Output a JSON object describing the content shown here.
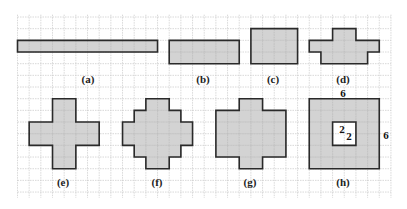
{
  "figure": {
    "grid": {
      "origin_x": 17.5,
      "origin_y": 17,
      "cell": 11.67,
      "cols": 32,
      "rows": 15.5,
      "line_color": "#c8c8c8",
      "fill_color": "#d3d3d3",
      "stroke_color": "#2a2a2a"
    },
    "shapes": [
      {
        "id": "a",
        "label": "(a)",
        "label_pos": [
          88,
          83
        ],
        "cells": [
          [
            0,
            2,
            12,
            1
          ]
        ]
      },
      {
        "id": "b",
        "label": "(b)",
        "label_pos": [
          203,
          83
        ],
        "cells": [
          [
            13,
            2,
            6,
            2
          ]
        ]
      },
      {
        "id": "c",
        "label": "(c)",
        "label_pos": [
          273,
          83
        ],
        "cells": [
          [
            20,
            1,
            4,
            3
          ]
        ]
      },
      {
        "id": "d",
        "label": "(d)",
        "label_pos": [
          343,
          83
        ],
        "cells": [
          [
            27,
            1,
            2,
            1
          ],
          [
            25,
            2,
            6,
            1
          ],
          [
            26,
            3,
            4,
            1
          ]
        ]
      },
      {
        "id": "e",
        "label": "(e)",
        "label_pos": [
          63,
          186
        ],
        "cells": [
          [
            3,
            7,
            2,
            2
          ],
          [
            1,
            9,
            6,
            2
          ],
          [
            3,
            11,
            2,
            2
          ]
        ]
      },
      {
        "id": "f",
        "label": "(f)",
        "label_pos": [
          157,
          186
        ],
        "cells": [
          [
            11,
            7,
            2,
            1
          ],
          [
            10,
            8,
            4,
            1
          ],
          [
            9,
            9,
            6,
            2
          ],
          [
            10,
            11,
            4,
            1
          ],
          [
            11,
            12,
            2,
            1
          ]
        ]
      },
      {
        "id": "g",
        "label": "(g)",
        "label_pos": [
          250,
          186
        ],
        "cells": [
          [
            19,
            7,
            2,
            1
          ],
          [
            17,
            8,
            6,
            4
          ],
          [
            19,
            12,
            2,
            1
          ]
        ]
      },
      {
        "id": "h",
        "label": "(h)",
        "label_pos": [
          343,
          186
        ],
        "cells": [
          [
            25,
            7,
            6,
            6
          ]
        ],
        "hole": [
          27,
          9,
          2,
          2
        ]
      }
    ],
    "annotations": [
      {
        "text": "6",
        "pos": [
          343,
          97
        ],
        "name": "h-width-label"
      },
      {
        "text": "6",
        "pos": [
          386,
          139
        ],
        "name": "h-height-label"
      },
      {
        "text": "2",
        "pos": [
          342,
          133
        ],
        "name": "hole-width-label"
      },
      {
        "text": "2",
        "pos": [
          349,
          140
        ],
        "name": "hole-height-label"
      }
    ]
  }
}
